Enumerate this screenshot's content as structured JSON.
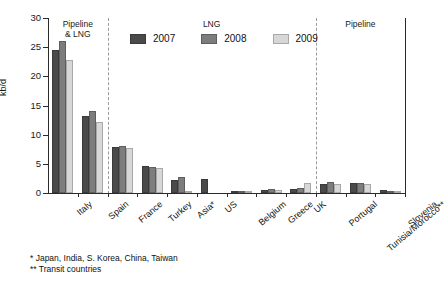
{
  "chart_data": {
    "type": "bar",
    "title": "",
    "xlabel": "",
    "ylabel": "kb/d",
    "ylim": [
      0,
      30
    ],
    "yticks": [
      0,
      5,
      10,
      15,
      20,
      25,
      30
    ],
    "grid": false,
    "legend_position": "top-center",
    "categories": [
      "Italy",
      "Spain",
      "France",
      "Turkey",
      "Asia*",
      "US",
      "Belgium",
      "Greece",
      "UK",
      "Portugal",
      "Tunisia/Morocco**",
      "Slovenia"
    ],
    "series": [
      {
        "name": "2007",
        "color": "#4a4a4a",
        "values": [
          24.5,
          13.2,
          7.9,
          4.6,
          2.3,
          2.4,
          0.35,
          0.55,
          0.75,
          1.5,
          1.7,
          0.5
        ]
      },
      {
        "name": "2008",
        "color": "#7d7d7d",
        "values": [
          26.0,
          14.0,
          8.0,
          4.5,
          2.7,
          0.0,
          0.15,
          0.75,
          0.9,
          1.9,
          1.8,
          0.4
        ]
      },
      {
        "name": "2009",
        "color": "#d7d7d7",
        "values": [
          22.8,
          12.2,
          7.8,
          4.3,
          0.15,
          0.0,
          0.05,
          0.5,
          1.8,
          1.6,
          1.6,
          0.3
        ]
      }
    ],
    "bands": [
      {
        "label_line1": "Pipeline",
        "label_line2": "& LNG",
        "categories": [
          "Italy",
          "Spain"
        ]
      },
      {
        "label_line1": "LNG",
        "label_line2": "",
        "categories": [
          "France",
          "Turkey",
          "Asia*",
          "US",
          "Belgium",
          "Greece",
          "UK"
        ]
      },
      {
        "label_line1": "Pipeline",
        "label_line2": "",
        "categories": [
          "Portugal",
          "Tunisia/Morocco**",
          "Slovenia"
        ]
      }
    ],
    "footnotes": [
      "* Japan, India, S. Korea, China, Taiwan",
      "** Transit countries"
    ]
  },
  "axis": {
    "y_title": "kb/d",
    "y_tick_labels": [
      "0",
      "5",
      "10",
      "15",
      "20",
      "25",
      "30"
    ]
  },
  "legend": {
    "items": [
      {
        "label": "2007"
      },
      {
        "label": "2008"
      },
      {
        "label": "2009"
      }
    ]
  },
  "footnotes": {
    "line1": "* Japan, India, S. Korea, China, Taiwan",
    "line2": "** Transit countries"
  },
  "bands": {
    "b0_l1": "Pipeline",
    "b0_l2": "& LNG",
    "b1_l1": "LNG",
    "b2_l1": "Pipeline"
  }
}
